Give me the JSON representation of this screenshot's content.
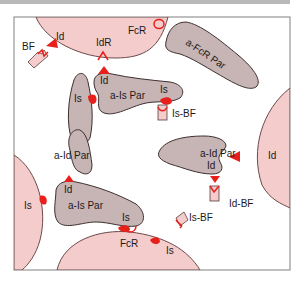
{
  "colors": {
    "cell_fill": "#f4cccc",
    "cell_stroke": "#6e4a4a",
    "parasite_fill": "#c7b4b4",
    "parasite_stroke": "#3f3030",
    "ligand_red": "#e8201c",
    "frame": "#808080"
  },
  "labels": {
    "bf_top": "BF",
    "id_top": "Id",
    "idr": "IdR",
    "fcr_top": "FcR",
    "a_fcr_par": "a-FcR Par",
    "is_left_par": "Is",
    "id_on_ais": "Id",
    "a_is_par_top": "a-Is Par",
    "is_on_ais": "Is",
    "is_bf_top": "Is-BF",
    "a_id_par_left": "a-Id Par",
    "id_right_cell": "Id",
    "a_id_par_right": "a-Id Par",
    "id_on_aid_right": "Id",
    "id_bf": "Id-BF",
    "is_left_cell": "Is",
    "id_on_ais_bottom": "Id",
    "a_is_par_bottom": "a-Is Par",
    "is_on_ais_bottom": "Is",
    "fcr_bottom": "FcR",
    "is_bf_bottom": "Is-BF",
    "is_bottom_cell": "Is"
  }
}
